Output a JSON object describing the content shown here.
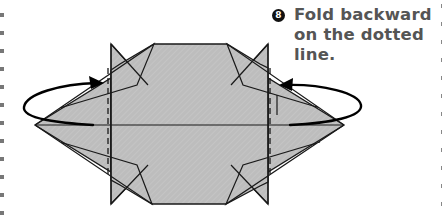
{
  "instruction": {
    "step_number": "8",
    "lines": [
      "Fold backward",
      "on the dotted",
      "line."
    ],
    "text": "Fold backward on the dotted line.",
    "color": "#555555"
  },
  "diagram": {
    "paper_fill": "#bdbdbd",
    "hatch_color": "#cfcfcf",
    "line_color": "#1a1a1a",
    "arrow_color": "#000000",
    "fold_type": "mountain fold (backward)",
    "dotted_lines": 2,
    "arrows": 2
  },
  "margins": {
    "left_marks_color": "#777777",
    "right_marks_color": "#888888"
  }
}
